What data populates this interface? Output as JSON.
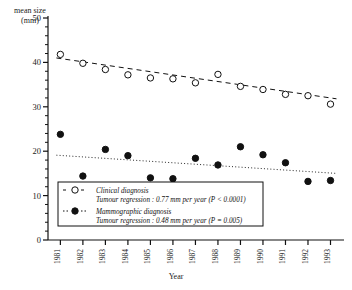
{
  "chart_data": {
    "type": "scatter",
    "title": "",
    "xlabel": "Year",
    "ylabel": "mean size (mm)",
    "ylim": [
      0,
      50
    ],
    "yticks": [
      0,
      10,
      20,
      30,
      40,
      50
    ],
    "yticklabels": [
      "0",
      "10",
      "20",
      "30",
      "40",
      "50"
    ],
    "minor_ticks": true,
    "grid": false,
    "categories": [
      1981,
      1982,
      1983,
      1984,
      1985,
      1986,
      1987,
      1988,
      1989,
      1990,
      1991,
      1992,
      1993
    ],
    "xticklabels": [
      "1981",
      "1982",
      "1983",
      "1984",
      "1985",
      "1986",
      "1987",
      "1988",
      "1989",
      "1990",
      "1991",
      "1992",
      "1993"
    ],
    "xtick_rotation": 90,
    "legend_position": "lower-left-inside",
    "series": [
      {
        "name": "Clinical diagnosis",
        "marker": "open-circle",
        "linestyle": "dashed",
        "values": [
          41.8,
          39.8,
          38.4,
          37.2,
          36.5,
          36.3,
          35.4,
          37.3,
          34.6,
          33.9,
          32.8,
          32.5,
          30.6
        ]
      },
      {
        "name": "Mammographic diagnosis",
        "marker": "filled-circle",
        "linestyle": "dotted",
        "values": [
          23.8,
          14.4,
          20.4,
          19.0,
          14.0,
          13.8,
          18.4,
          16.9,
          21.0,
          19.2,
          17.4,
          13.2,
          13.4
        ]
      }
    ],
    "trendlines": [
      {
        "name": "Clinical diagnosis trend",
        "style": "dashed",
        "y_start": 41.0,
        "y_end": 31.8
      },
      {
        "name": "Mammographic diagnosis trend",
        "style": "dotted",
        "y_start": 19.1,
        "y_end": 15.0
      }
    ]
  },
  "legend": {
    "entries": [
      {
        "marker": "open-circle",
        "label": "Clinical diagnosis",
        "stat": "Tumour regression : 0.77 mm per year (P < 0.0001)"
      },
      {
        "marker": "filled-circle",
        "label": "Mammographic diagnosis",
        "stat": "Tumour regression : 0.48 mm per year (P = 0.005)"
      }
    ]
  }
}
